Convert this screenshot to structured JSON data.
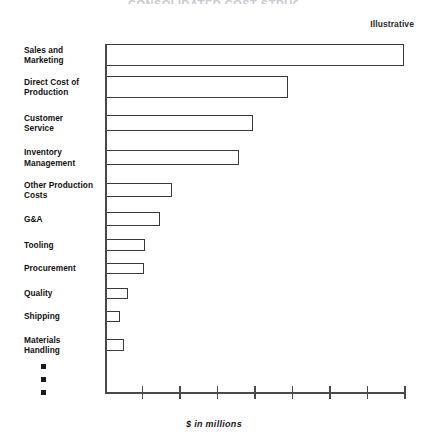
{
  "annotation": {
    "illustrative_label": "Illustrative",
    "title_remnant": "CONSOLIDATED COST STRUCTURE"
  },
  "axis": {
    "x_title": "$ in millions",
    "tick_count": 8,
    "tick_labels": [
      "",
      "",
      "",
      "",
      "",
      "",
      "",
      ""
    ]
  },
  "continuation": {
    "bullet_count": 3,
    "bullet_glyph": "square-bullet"
  },
  "chart_data": {
    "type": "bar",
    "orientation": "horizontal",
    "title": "",
    "xlabel": "$ in millions",
    "ylabel": "",
    "xlim": [
      0,
      8
    ],
    "grid": false,
    "legend": "none",
    "bar_style": "outlined-unfilled",
    "sorted": "descending",
    "categories": [
      "Sales and Marketing",
      "Direct Cost of Production",
      "Customer Service",
      "Inventory Management",
      "Other Production Costs",
      "G&A",
      "Tooling",
      "Procurement",
      "Quality",
      "Shipping",
      "Materials Handling"
    ],
    "values": [
      8.0,
      4.9,
      3.9,
      3.6,
      1.8,
      1.45,
      1.05,
      1.0,
      0.6,
      0.38,
      0.48
    ]
  },
  "bars": [
    {
      "label": "Sales and\nMarketing",
      "line1": "Sales and",
      "line2": "Marketing",
      "value": 8.0,
      "top": 44,
      "height": 22,
      "width": 298
    },
    {
      "label": "Direct Cost of Production",
      "line1": "Direct Cost of",
      "line2": "Production",
      "value": 4.9,
      "top": 76,
      "height": 22,
      "width": 182
    },
    {
      "label": "Customer Service",
      "line1": "Customer",
      "line2": "Service",
      "value": 3.9,
      "top": 115,
      "height": 16,
      "width": 147
    },
    {
      "label": "Inventory Management",
      "line1": "Inventory",
      "line2": "Management",
      "value": 3.6,
      "top": 150,
      "height": 15,
      "width": 133
    },
    {
      "label": "Other Production Costs",
      "line1": "Other Production",
      "line2": "Costs",
      "value": 1.8,
      "top": 183,
      "height": 14,
      "width": 66
    },
    {
      "label": "G&A",
      "line1": "G&A",
      "line2": "",
      "value": 1.45,
      "top": 212,
      "height": 14,
      "width": 54
    },
    {
      "label": "Tooling",
      "line1": "Tooling",
      "line2": "",
      "value": 1.05,
      "top": 239,
      "height": 12,
      "width": 39
    },
    {
      "label": "Procurement",
      "line1": "Procurement",
      "line2": "",
      "value": 1.0,
      "top": 263,
      "height": 11,
      "width": 38
    },
    {
      "label": "Quality",
      "line1": "Quality",
      "line2": "",
      "value": 0.6,
      "top": 288,
      "height": 11,
      "width": 22
    },
    {
      "label": "Shipping",
      "line1": "Shipping",
      "line2": "",
      "value": 0.38,
      "top": 311,
      "height": 11,
      "width": 14
    },
    {
      "label": "Materials Handling",
      "line1": "Materials",
      "line2": "Handling",
      "value": 0.48,
      "top": 339,
      "height": 12,
      "width": 18
    }
  ]
}
